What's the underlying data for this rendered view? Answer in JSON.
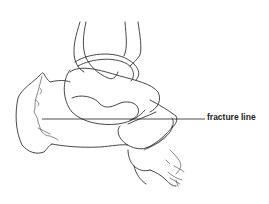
{
  "diagram": {
    "labels": [
      {
        "id": "fracture-line",
        "text": "fracture line"
      }
    ],
    "colors": {
      "background": "#ffffff",
      "line": "#333333",
      "label": "#222222"
    }
  }
}
